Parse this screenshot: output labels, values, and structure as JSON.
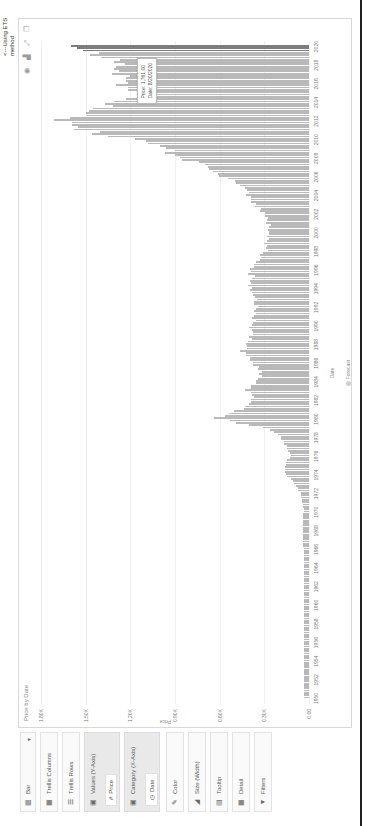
{
  "panel": {
    "chart_type": {
      "icon": "bar-chart-icon",
      "label": "Bar"
    },
    "trellis_columns": {
      "icon": "trellis-columns-icon",
      "label": "Trellis Columns"
    },
    "trellis_rows": {
      "icon": "trellis-rows-icon",
      "label": "Trellis Rows"
    },
    "value_axis": {
      "icon": "value-axis-icon",
      "label": "Values (Y-Axis)",
      "field_icon": "number-icon",
      "field": "Price"
    },
    "category_axis": {
      "icon": "category-axis-icon",
      "label": "Category (X-Axis)",
      "field_icon": "clock-icon",
      "field": "Date"
    },
    "color": {
      "icon": "color-icon",
      "label": "Color"
    },
    "size": {
      "icon": "size-icon",
      "label": "Size (Width)"
    },
    "tooltip": {
      "icon": "tooltip-icon",
      "label": "Tooltip"
    },
    "detail": {
      "icon": "detail-icon",
      "label": "Detail"
    },
    "filters": {
      "icon": "filter-icon",
      "label": "Filters"
    }
  },
  "chart": {
    "title": "Price by Date",
    "toolbar": [
      "info-icon",
      "chart-icon",
      "expand-icon",
      "copy-icon"
    ],
    "tooltip": {
      "line1": "Price: 1,761.00",
      "line2": "Date: 8/20/2020"
    },
    "annotation": {
      "line1": "<---Using ETS",
      "line2": "method"
    },
    "legend": "Forecast"
  },
  "chart_data": {
    "type": "bar",
    "title": "Price by Date",
    "xlabel": "Date",
    "ylabel": "Price",
    "ylim": [
      0,
      1800
    ],
    "y_ticks": [
      "1.80K",
      "1.50K",
      "1.20K",
      "0.90K",
      "0.60K",
      "0.30K",
      "0.00"
    ],
    "x_ticks": [
      "1950",
      "1952",
      "1954",
      "1956",
      "1958",
      "1960",
      "1962",
      "1964",
      "1966",
      "1968",
      "1970",
      "1972",
      "1974",
      "1976",
      "1978",
      "1980",
      "1982",
      "1984",
      "1986",
      "1988",
      "1990",
      "1992",
      "1994",
      "1996",
      "1998",
      "2000",
      "2002",
      "2004",
      "2006",
      "2008",
      "2010",
      "2012",
      "2014",
      "2016",
      "2018",
      "2020"
    ],
    "grid": true,
    "legend": [
      "Forecast"
    ],
    "series": [
      {
        "name": "Price",
        "x": [
          1950,
          1955,
          1960,
          1965,
          1968,
          1970,
          1972,
          1973,
          1974,
          1975,
          1976,
          1977,
          1978,
          1979,
          1980,
          1981,
          1982,
          1983,
          1984,
          1985,
          1986,
          1987,
          1988,
          1989,
          1990,
          1991,
          1992,
          1993,
          1994,
          1995,
          1996,
          1997,
          1998,
          1999,
          2000,
          2001,
          2002,
          2003,
          2004,
          2005,
          2006,
          2007,
          2008,
          2009,
          2010,
          2011,
          2012,
          2013,
          2014,
          2015,
          2016,
          2017,
          2018,
          2019
        ],
        "values": [
          35,
          35,
          35,
          35,
          40,
          36,
          58,
          97,
          155,
          160,
          125,
          148,
          195,
          305,
          640,
          460,
          375,
          425,
          360,
          318,
          368,
          447,
          437,
          381,
          383,
          362,
          343,
          360,
          384,
          384,
          388,
          331,
          294,
          279,
          279,
          271,
          310,
          363,
          409,
          445,
          604,
          695,
          872,
          972,
          1225,
          1572,
          1669,
          1411,
          1266,
          1160,
          1251,
          1257,
          1268,
          1393
        ]
      },
      {
        "name": "Forecast",
        "x": [
          2019.5,
          2020
        ],
        "values": [
          1520,
          1600
        ]
      }
    ]
  }
}
